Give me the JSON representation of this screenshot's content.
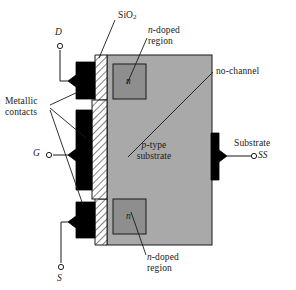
{
  "figure": {
    "colors": {
      "substrate_fill": "#a9a9a9",
      "n_region_fill": "#8e8e8e",
      "contact_fill": "#000000",
      "oxide_hatch": "#000000",
      "outline": "#1a1a1a",
      "background": "#ffffff"
    }
  },
  "terminals": {
    "drain": {
      "label": "D"
    },
    "gate": {
      "label": "G"
    },
    "source": {
      "label": "S"
    },
    "substrate": {
      "label": "SS",
      "caption": "Substrate"
    }
  },
  "labels": {
    "oxide": {
      "text": "SiO",
      "subscript": "2"
    },
    "n_doped_top": {
      "line1": "n-doped",
      "line2": "region"
    },
    "n_doped_bottom": {
      "line1": "n-doped",
      "line2": "region"
    },
    "metallic_contacts": {
      "line1": "Metallic",
      "line2": "contacts"
    },
    "no_channel": {
      "text": "no-channel"
    },
    "substrate_body": {
      "line1": "p-type",
      "line2": "substrate"
    },
    "n_top_symbol": {
      "text": "n"
    },
    "n_bottom_symbol": {
      "text": "n"
    }
  }
}
